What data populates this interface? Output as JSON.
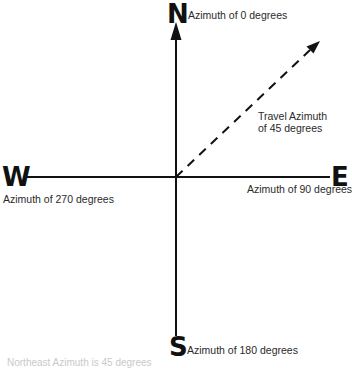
{
  "diagram": {
    "type": "compass-azimuth",
    "directions": {
      "north": {
        "letter": "N",
        "label": "Azimuth of 0 degrees"
      },
      "east": {
        "letter": "E",
        "label": "Azimuth of 90 degrees"
      },
      "south": {
        "letter": "S",
        "label": "Azimuth of 180 degrees"
      },
      "west": {
        "letter": "W",
        "label": "Azimuth of 270 degrees"
      }
    },
    "travel": {
      "label_line1": "Travel Azimuth",
      "label_line2": "of 45 degrees",
      "azimuth": 45
    },
    "caption": "Northeast Azimuth is 45 degrees",
    "colors": {
      "lines": "#111111",
      "text": "#2a2a2a",
      "caption": "#c9c9c9"
    }
  }
}
